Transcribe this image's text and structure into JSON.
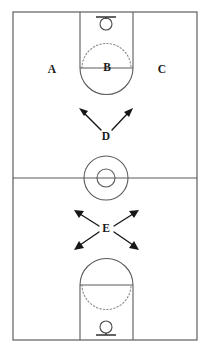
{
  "diagram": {
    "type": "basketball-court-movement-diagram",
    "orientation": "vertical",
    "background_color": "#ffffff",
    "line_color": "#5a5a5a",
    "arrow_color": "#171717",
    "label_color": "#1a1a1a",
    "court": {
      "left": 13,
      "top": 12,
      "right": 197,
      "bottom": 340,
      "halfcourt_line_y": 178
    },
    "zone_labels": [
      {
        "id": "A",
        "text": "A",
        "x": 52,
        "y": 70,
        "description": "left wing area near free-throw line extended"
      },
      {
        "id": "B",
        "text": "B",
        "x": 107,
        "y": 68,
        "description": "free-throw line center of the key"
      },
      {
        "id": "C",
        "text": "C",
        "x": 162,
        "y": 70,
        "description": "right wing area near free-throw line extended"
      },
      {
        "id": "D",
        "text": "D",
        "x": 106,
        "y": 137,
        "description": "two-arrow split position above half court"
      },
      {
        "id": "E",
        "text": "E",
        "x": 106,
        "y": 229,
        "description": "four-arrow X position below half court"
      }
    ],
    "arrow_groups": [
      {
        "label": "D",
        "origin_x": 106,
        "origin_y": 130,
        "count": 2,
        "directions": [
          "up-left",
          "up-right"
        ]
      },
      {
        "label": "E",
        "origin_x": 106,
        "origin_y": 227,
        "count": 4,
        "directions": [
          "up-left",
          "up-right",
          "down-left",
          "down-right"
        ]
      }
    ],
    "center_circle": {
      "cx": 106,
      "cy": 178,
      "outer_radius": 22,
      "inner_radius": 9
    },
    "keys": [
      {
        "id": "top-key",
        "lane_left": 80,
        "lane_right": 133,
        "baseline_y": 12,
        "freethrow_line_y": 68,
        "arc_radius": 26,
        "solid_arc": "below-freethrow-line",
        "dotted_arc": "above-freethrow-line",
        "hoop": {
          "cx": 106,
          "cy": 24,
          "ring_radius": 6,
          "backboard_y": 16,
          "backboard_half_width": 10
        }
      },
      {
        "id": "bottom-key",
        "lane_left": 80,
        "lane_right": 133,
        "baseline_y": 340,
        "freethrow_line_y": 285,
        "arc_radius": 26,
        "solid_arc": "above-freethrow-line",
        "dotted_arc": "below-freethrow-line",
        "hoop": {
          "cx": 106,
          "cy": 328,
          "ring_radius": 6,
          "backboard_y": 336,
          "backboard_half_width": 10
        }
      }
    ]
  }
}
